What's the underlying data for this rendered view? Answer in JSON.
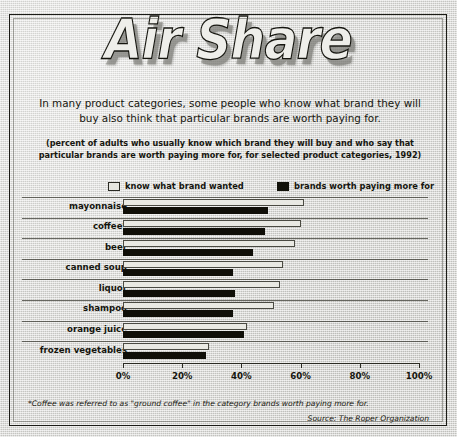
{
  "title": "Air Share",
  "deck": "In many product categories, some people who know what brand they will buy also think that particular brands are worth paying for.",
  "subdeck": "(percent of adults who usually know which brand they will buy and who say that particular brands are worth paying more for, for selected product categories, 1992)",
  "footnote": "*Coffee was referred to as \"ground coffee\" in the category brands worth paying more for.",
  "source": "Source: The Roper Organization",
  "colors": {
    "light_series": "#e9e9e3",
    "dark_series": "#100f08",
    "text": "#15150e",
    "paper": "#d3d3cf",
    "rule": "#3a3a32"
  },
  "legend": {
    "items": [
      {
        "label": "know what brand wanted",
        "swatch": "light"
      },
      {
        "label": "brands worth paying more for",
        "swatch": "dark"
      }
    ]
  },
  "chart_data": {
    "type": "bar",
    "orientation": "horizontal",
    "title": "Air Share",
    "xlabel": "",
    "ylabel": "",
    "xlim": [
      0,
      100
    ],
    "xticks": [
      0,
      20,
      40,
      60,
      80,
      100
    ],
    "xticklabels": [
      "0%",
      "20%",
      "40%",
      "60%",
      "80%",
      "100%"
    ],
    "grid": false,
    "legend_position": "top",
    "categories": [
      "mayonnaise",
      "coffee*",
      "beer",
      "canned soup",
      "liquor",
      "shampoo",
      "orange juice",
      "frozen vegetables"
    ],
    "series": [
      {
        "name": "know what brand wanted",
        "color": "#e9e9e3",
        "values": [
          61,
          60,
          58,
          54,
          53,
          51,
          42,
          29
        ]
      },
      {
        "name": "brands worth paying more for",
        "color": "#100f08",
        "values": [
          49,
          48,
          44,
          37,
          38,
          37,
          41,
          28
        ]
      }
    ]
  }
}
